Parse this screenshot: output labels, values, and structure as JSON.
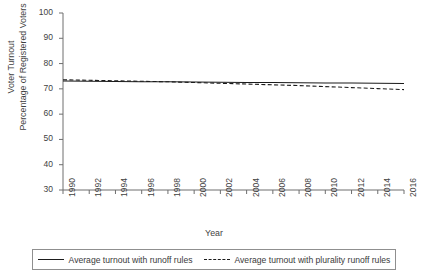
{
  "chart_data": {
    "type": "line",
    "title": "",
    "xlabel": "Year",
    "ylabel_line1": "Voter Turnout",
    "ylabel_line2": "Percentage of Registered Voters",
    "x": [
      1990,
      1992,
      1994,
      1996,
      1998,
      2000,
      2002,
      2004,
      2006,
      2008,
      2010,
      2012,
      2014,
      2016
    ],
    "xtick_labels": [
      "1990",
      "1992",
      "1994",
      "1996",
      "1998",
      "2000",
      "2002",
      "2004",
      "2006",
      "2008",
      "2010",
      "2012",
      "2014",
      "2016"
    ],
    "ytick_labels": [
      "30",
      "40",
      "50",
      "60",
      "70",
      "80",
      "90",
      "100"
    ],
    "yticks": [
      30,
      40,
      50,
      60,
      70,
      80,
      90,
      100
    ],
    "xlim": [
      1990,
      2016
    ],
    "ylim": [
      30,
      100
    ],
    "grid": false,
    "legend_position": "below-center",
    "series": [
      {
        "name": "Average turnout with runoff rules",
        "style": "solid",
        "color": "#1b1b1b",
        "values": [
          73.1,
          73.0,
          72.9,
          72.8,
          72.8,
          72.7,
          72.6,
          72.5,
          72.5,
          72.4,
          72.3,
          72.3,
          72.2,
          72.1
        ]
      },
      {
        "name": "Average turnout with plurality runoff rules",
        "style": "dashed",
        "color": "#1b1b1b",
        "values": [
          73.6,
          73.4,
          73.2,
          73.0,
          72.8,
          72.5,
          72.2,
          71.9,
          71.6,
          71.3,
          70.9,
          70.5,
          70.1,
          69.7
        ]
      }
    ],
    "legend": [
      {
        "label": "Average turnout with runoff rules",
        "style": "solid"
      },
      {
        "label": "Average turnout with plurality runoff rules",
        "style": "dashed"
      }
    ],
    "colors": {
      "axis": "#6e6e6e",
      "line": "#1b1b1b",
      "text": "#3f3f3f",
      "background": "#ffffff"
    }
  }
}
